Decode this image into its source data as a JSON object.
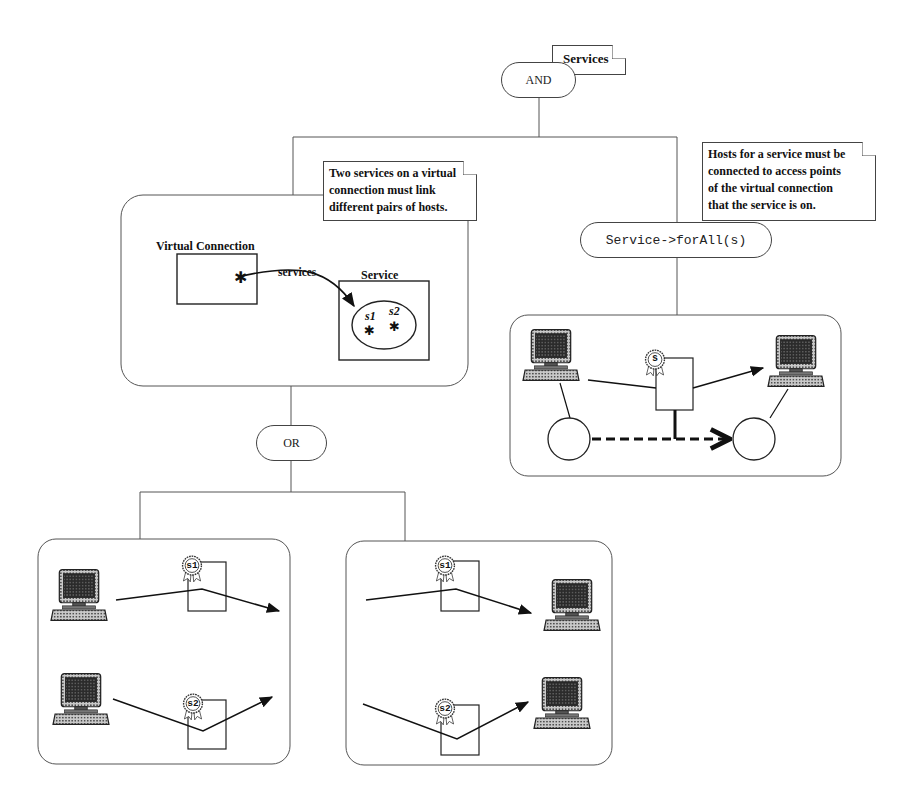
{
  "root": {
    "title_note": "Services",
    "operator": "AND"
  },
  "left_branch": {
    "note": [
      "Two services on a virtual",
      "connection must link",
      "different pairs of hosts."
    ],
    "schema": {
      "virtual_connection_label": "Virtual Connection",
      "association_label": "services",
      "service_label": "Service",
      "instances": [
        "s1",
        "s2"
      ]
    },
    "operator": "OR",
    "alternatives": [
      {
        "name": "alternative-left",
        "services": [
          "s1",
          "s2"
        ],
        "hosts_position": "left"
      },
      {
        "name": "alternative-right",
        "services": [
          "s1",
          "s2"
        ],
        "hosts_position": "right"
      }
    ]
  },
  "right_branch": {
    "note": [
      "Hosts for a service must be",
      "connected to access points",
      "of the virtual connection",
      "that the service is on."
    ],
    "quantifier": "Service->forAll(s)",
    "scene": {
      "service_badge": "s"
    }
  },
  "colors": {
    "line": "#444444",
    "ink": "#111111",
    "background": "#ffffff"
  }
}
